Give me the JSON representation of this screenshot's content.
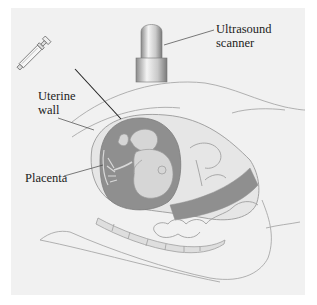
{
  "figure": {
    "labels": {
      "scanner": {
        "line1": "Ultrasound",
        "line2": "scanner"
      },
      "uterine_wall": {
        "line1": "Uterine",
        "line2": "wall"
      },
      "placenta": {
        "line1": "Placenta"
      }
    },
    "parts": [
      "ultrasound-scanner",
      "syringe-needle",
      "uterine-wall",
      "amniotic-sac",
      "fetus",
      "placenta",
      "abdomen-outline",
      "spine"
    ],
    "colors": {
      "panel_bg": "#f1f1f1",
      "amniotic_fill": "#8f8f8f",
      "fetus_fill": "#d6d6d6",
      "outline": "#9a9a9a",
      "leader_line": "#333333",
      "label_text": "#222222"
    }
  }
}
